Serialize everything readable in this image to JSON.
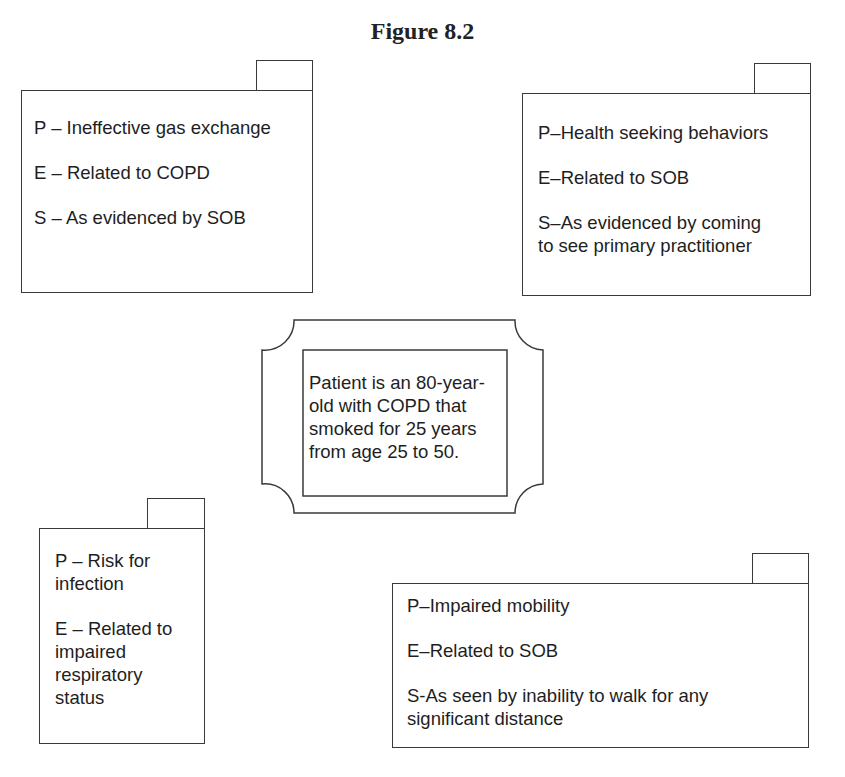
{
  "figure": {
    "title": "Figure 8.2"
  },
  "center": {
    "text_lines": [
      "Patient is an 80-year-",
      "old with COPD that",
      "smoked for 25 years",
      "from age 25 to 50."
    ]
  },
  "diagnoses": {
    "top_left": {
      "p": "P – Ineffective gas exchange",
      "e": "E – Related to COPD",
      "s": "S – As evidenced by SOB"
    },
    "top_right": {
      "p": "P–Health seeking behaviors",
      "e": "E–Related to SOB",
      "s_lines": [
        "S–As evidenced by coming",
        "to see primary practitioner"
      ]
    },
    "bottom_left": {
      "p_lines": [
        "P – Risk for",
        "infection"
      ],
      "e_lines": [
        "E – Related to",
        "impaired",
        "respiratory",
        "status"
      ]
    },
    "bottom_right": {
      "p": "P–Impaired mobility",
      "e": "E–Related to SOB",
      "s_lines": [
        "S-As seen by inability to walk for any",
        "significant distance"
      ]
    }
  },
  "colors": {
    "stroke": "#3a3a3a",
    "text": "#1e1e1e",
    "background": "#ffffff"
  }
}
